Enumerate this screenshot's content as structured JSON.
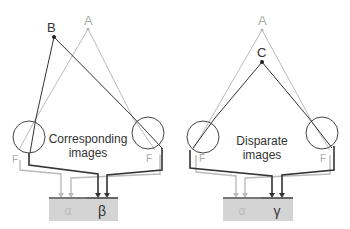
{
  "colors": {
    "dark_line": "#333333",
    "light_line": "#bbbbbb",
    "eye_outline": "#444444",
    "box_fill": "#d4d4d4",
    "box_top": "#666666",
    "point_dark": "#222222",
    "point_light": "#bbbbbb",
    "text_dark": "#333333",
    "text_light": "#aaaaaa"
  },
  "panels": [
    {
      "id": "corresponding",
      "caption_line1": "Corresponding",
      "caption_line2": "images",
      "points": [
        {
          "label": "A",
          "style": "light"
        },
        {
          "label": "B",
          "style": "dark"
        }
      ],
      "fovea_left": "F",
      "fovea_right": "F",
      "boxes": [
        {
          "label": "α",
          "style": "light"
        },
        {
          "label": "β",
          "style": "dark"
        }
      ]
    },
    {
      "id": "disparate",
      "caption_line1": "Disparate",
      "caption_line2": "images",
      "points": [
        {
          "label": "A",
          "style": "light"
        },
        {
          "label": "C",
          "style": "dark"
        }
      ],
      "fovea_left": "F",
      "fovea_right": "F",
      "boxes": [
        {
          "label": "α",
          "style": "light"
        },
        {
          "label": "γ",
          "style": "dark"
        }
      ]
    }
  ]
}
